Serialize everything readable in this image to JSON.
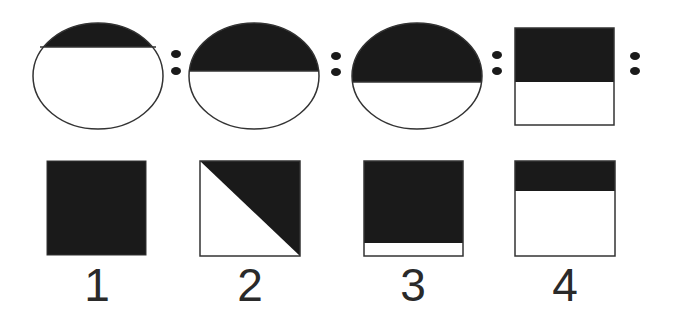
{
  "puzzle": {
    "type": "analogy",
    "colors": {
      "fill": "#1a1a1a",
      "stroke": "#333333",
      "background": "#ffffff"
    },
    "question_row": [
      {
        "shape": "ellipse",
        "filled_fraction_top": 0.23
      },
      {
        "separator": "::"
      },
      {
        "shape": "ellipse",
        "filled_fraction_top": 0.46
      },
      {
        "separator": "::"
      },
      {
        "shape": "ellipse",
        "filled_fraction_top": 0.55
      },
      {
        "separator": "::"
      },
      {
        "shape": "square",
        "filled_fraction_top": 0.56
      },
      {
        "separator": "::"
      }
    ],
    "options": [
      {
        "label": "1",
        "description": "fully filled square"
      },
      {
        "label": "2",
        "description": "square filled on upper-right diagonal half"
      },
      {
        "label": "3",
        "description": "square filled except thin bottom strip"
      },
      {
        "label": "4",
        "description": "square with thin top filled band"
      }
    ]
  }
}
